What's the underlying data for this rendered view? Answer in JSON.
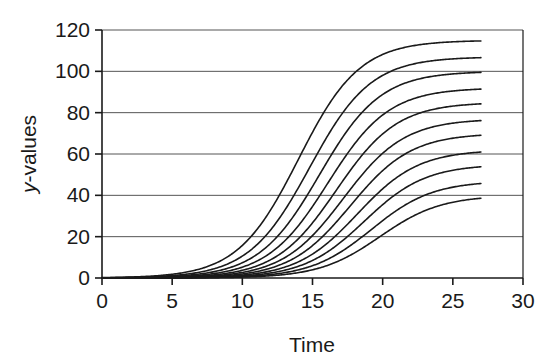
{
  "chart_data": {
    "type": "line",
    "title": "",
    "xlabel": "Time",
    "ylabel": "y-values",
    "ylabel_parts": {
      "italic": "y",
      "rest": "-values"
    },
    "xlim": [
      0,
      30
    ],
    "ylim": [
      0,
      120
    ],
    "xticks": [
      0,
      5,
      10,
      15,
      20,
      25,
      30
    ],
    "yticks": [
      0,
      20,
      40,
      60,
      80,
      100,
      120
    ],
    "xtick_labels": [
      "0",
      "5",
      "10",
      "15",
      "20",
      "25",
      "30"
    ],
    "ytick_labels": [
      "0",
      "20",
      "40",
      "60",
      "80",
      "100",
      "120"
    ],
    "grid": "horizontal",
    "legend": "none",
    "line_color": "#1a1a1a",
    "line_width": 1.6,
    "x_data_end": 27,
    "series_note": "Eleven logistic (sigmoid) growth curves, each starting near 0 and saturating at a different plateau; onset shifts progressively later for lower plateaus.",
    "series": [
      {
        "name": "curve-1",
        "plateau": 115,
        "midpoint": 14.0,
        "rate": 0.46,
        "end_value": 114
      },
      {
        "name": "curve-2",
        "plateau": 107,
        "midpoint": 14.8,
        "rate": 0.46,
        "end_value": 106
      },
      {
        "name": "curve-3",
        "plateau": 100,
        "midpoint": 15.5,
        "rate": 0.46,
        "end_value": 99
      },
      {
        "name": "curve-4",
        "plateau": 92,
        "midpoint": 16.1,
        "rate": 0.46,
        "end_value": 91
      },
      {
        "name": "curve-5",
        "plateau": 85,
        "midpoint": 16.7,
        "rate": 0.46,
        "end_value": 84
      },
      {
        "name": "curve-6",
        "plateau": 77,
        "midpoint": 17.2,
        "rate": 0.46,
        "end_value": 76
      },
      {
        "name": "curve-7",
        "plateau": 70,
        "midpoint": 17.7,
        "rate": 0.46,
        "end_value": 69
      },
      {
        "name": "curve-8",
        "plateau": 62,
        "midpoint": 18.2,
        "rate": 0.46,
        "end_value": 61
      },
      {
        "name": "curve-9",
        "plateau": 55,
        "midpoint": 18.7,
        "rate": 0.46,
        "end_value": 54
      },
      {
        "name": "curve-10",
        "plateau": 47,
        "midpoint": 19.2,
        "rate": 0.46,
        "end_value": 46
      },
      {
        "name": "curve-11",
        "plateau": 40,
        "midpoint": 19.8,
        "rate": 0.46,
        "end_value": 39
      }
    ]
  },
  "geometry": {
    "plot_left": 102,
    "plot_right": 523,
    "plot_top": 30,
    "plot_bottom": 278
  }
}
